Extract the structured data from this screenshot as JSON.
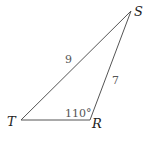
{
  "diagram": {
    "type": "triangle",
    "vertices": {
      "S": {
        "label": "S"
      },
      "T": {
        "label": "T"
      },
      "R": {
        "label": "R"
      }
    },
    "sides": {
      "TS": {
        "label": "9"
      },
      "RS": {
        "label": "7"
      }
    },
    "angles": {
      "R": {
        "label": "110°"
      }
    },
    "colors": {
      "line": "#555555",
      "text": "#222222"
    }
  }
}
